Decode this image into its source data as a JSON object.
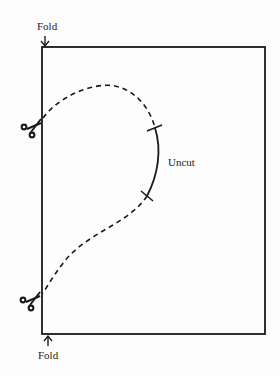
{
  "diagram": {
    "labels": {
      "top_fold": "Fold",
      "bottom_fold": "Fold",
      "uncut": "Uncut"
    },
    "icons": [
      "scissors-icon",
      "scissors-icon",
      "arrow-down-icon",
      "arrow-up-icon"
    ],
    "line_color": "#1a1a1a"
  }
}
